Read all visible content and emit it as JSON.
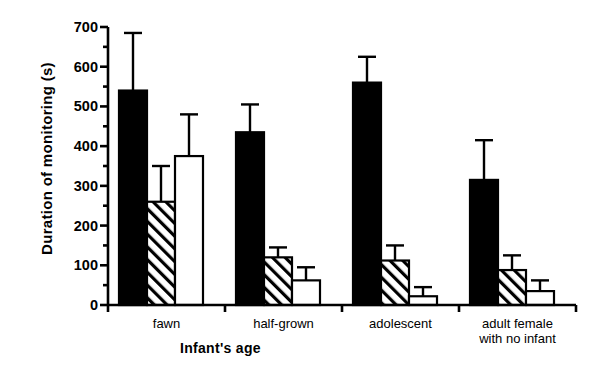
{
  "chart_data": {
    "type": "bar",
    "title": "",
    "xlabel": "Infant's age",
    "ylabel": "Duration of monitoring (s)",
    "categories": [
      "fawn",
      "half-grown",
      "adolescent",
      "adult female\nwith no infant"
    ],
    "category_lines": [
      [
        "fawn"
      ],
      [
        "half-grown"
      ],
      [
        "adolescent"
      ],
      [
        "adult female",
        "with no infant"
      ]
    ],
    "ylim": [
      0,
      700
    ],
    "yticks": [
      0,
      100,
      200,
      300,
      400,
      500,
      600,
      700
    ],
    "ytick_labels": [
      "0",
      "100",
      "200",
      "300",
      "400",
      "500",
      "600",
      "700"
    ],
    "minor_ytick_step": 50,
    "grid": false,
    "legend": "none",
    "error_bar_type": "upper-only",
    "series": [
      {
        "name": "series-1",
        "fill": "solid-black",
        "color": "#000000",
        "values": [
          540,
          435,
          560,
          315
        ],
        "errors": [
          145,
          70,
          65,
          100
        ]
      },
      {
        "name": "series-2",
        "fill": "diagonal-hatch",
        "color": "#ffffff",
        "values": [
          260,
          120,
          112,
          88
        ],
        "errors": [
          90,
          25,
          38,
          37
        ]
      },
      {
        "name": "series-3",
        "fill": "open-white",
        "color": "#ffffff",
        "values": [
          375,
          62,
          22,
          35
        ],
        "errors": [
          105,
          33,
          23,
          27
        ]
      }
    ]
  },
  "axis": {
    "y_axis_name": "y-axis",
    "x_axis_name": "x-axis"
  }
}
